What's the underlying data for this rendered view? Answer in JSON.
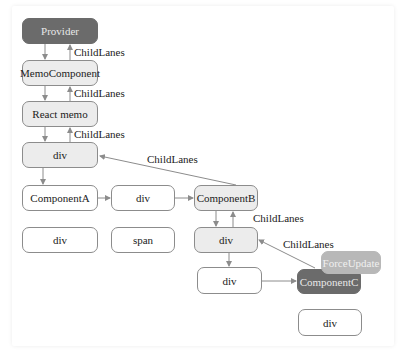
{
  "diagram": {
    "nodes": {
      "provider": "Provider",
      "memo_component": "MemoComponent",
      "react_memo": "React memo",
      "div_root": "div",
      "component_a": "ComponentA",
      "div_mid": "div",
      "component_b": "ComponentB",
      "div_a_child": "div",
      "span": "span",
      "div_b_child": "div",
      "div_lower": "div",
      "component_c": "ComponentC",
      "force_update": "ForceUpdate",
      "div_c_child": "div"
    },
    "edge_labels": {
      "l1": "ChildLanes",
      "l2": "ChildLanes",
      "l3": "ChildLanes",
      "l4": "ChildLanes",
      "l5": "ChildLanes",
      "l6": "ChildLanes"
    },
    "colors": {
      "dark_node": "#6b6b6b",
      "light_node": "#b8b8b8",
      "gray_node": "#ececec",
      "edge": "#8c8c8c"
    }
  }
}
